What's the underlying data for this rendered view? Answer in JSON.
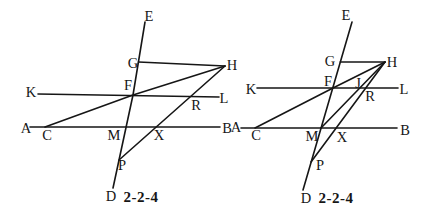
{
  "colors": {
    "ink": "#161616",
    "paper": "#ffffff"
  },
  "diagrams": [
    {
      "name": "left",
      "caption": "2-2-4",
      "caption_pos": {
        "x": 141,
        "y": 197
      },
      "lines": [
        {
          "name": "transversal-ED",
          "points": [
            [
              145,
              22
            ],
            [
              133,
              95
            ],
            [
              113,
              188
            ]
          ]
        },
        {
          "name": "horizontal-KL",
          "points": [
            [
              38,
              94
            ],
            [
              219,
              97
            ]
          ]
        },
        {
          "name": "horizontal-AB",
          "points": [
            [
              30,
              127
            ],
            [
              220,
              127
            ]
          ]
        },
        {
          "name": "segment-GH",
          "points": [
            [
              138.5,
              62
            ],
            [
              225,
              66
            ]
          ]
        },
        {
          "name": "line-CFH",
          "points": [
            [
              45,
              127
            ],
            [
              133,
              95
            ],
            [
              225,
              66
            ]
          ]
        },
        {
          "name": "line-HRXP",
          "points": [
            [
              225,
              66
            ],
            [
              119,
              160
            ]
          ]
        }
      ],
      "labels": [
        {
          "text": "E",
          "x": 149,
          "y": 16
        },
        {
          "text": "G",
          "x": 133,
          "y": 63
        },
        {
          "text": "H",
          "x": 232,
          "y": 65
        },
        {
          "text": "K",
          "x": 31,
          "y": 92
        },
        {
          "text": "F",
          "x": 128,
          "y": 85
        },
        {
          "text": "R",
          "x": 196,
          "y": 105
        },
        {
          "text": "L",
          "x": 224,
          "y": 98
        },
        {
          "text": "A",
          "x": 26,
          "y": 128
        },
        {
          "text": "C",
          "x": 47,
          "y": 135
        },
        {
          "text": "M",
          "x": 114,
          "y": 135
        },
        {
          "text": "X",
          "x": 159,
          "y": 135
        },
        {
          "text": "B",
          "x": 227,
          "y": 128
        },
        {
          "text": "P",
          "x": 122,
          "y": 165
        },
        {
          "text": "D",
          "x": 111,
          "y": 196
        }
      ]
    },
    {
      "name": "right",
      "caption": "2-2-4",
      "caption_pos": {
        "x": 336,
        "y": 198
      },
      "lines": [
        {
          "name": "transversal-ED",
          "points": [
            [
              352,
              22
            ],
            [
              303,
              190
            ]
          ]
        },
        {
          "name": "horizontal-KL",
          "points": [
            [
              257,
              88
            ],
            [
              398,
              88
            ]
          ]
        },
        {
          "name": "horizontal-AB",
          "points": [
            [
              241,
              128
            ],
            [
              397,
              128
            ]
          ]
        },
        {
          "name": "segment-GH",
          "points": [
            [
              340.3,
              62
            ],
            [
              385,
              62
            ]
          ]
        },
        {
          "name": "line-CFH",
          "points": [
            [
              255,
              128
            ],
            [
              333,
              88
            ],
            [
              385,
              62
            ]
          ]
        },
        {
          "name": "line-HRXP",
          "points": [
            [
              385,
              62
            ],
            [
              311,
              162
            ]
          ]
        },
        {
          "name": "segment-MJH",
          "points": [
            [
              321,
              128
            ],
            [
              385,
              62
            ]
          ]
        }
      ],
      "labels": [
        {
          "text": "E",
          "x": 346,
          "y": 15
        },
        {
          "text": "G",
          "x": 330,
          "y": 61
        },
        {
          "text": "H",
          "x": 392,
          "y": 62
        },
        {
          "text": "K",
          "x": 251,
          "y": 89
        },
        {
          "text": "F",
          "x": 328,
          "y": 81
        },
        {
          "text": "J",
          "x": 358,
          "y": 83
        },
        {
          "text": "R",
          "x": 370,
          "y": 96
        },
        {
          "text": "L",
          "x": 404,
          "y": 89
        },
        {
          "text": "A",
          "x": 236,
          "y": 127
        },
        {
          "text": "C",
          "x": 256,
          "y": 135
        },
        {
          "text": "M",
          "x": 312,
          "y": 136
        },
        {
          "text": "X",
          "x": 342,
          "y": 137
        },
        {
          "text": "B",
          "x": 405,
          "y": 130
        },
        {
          "text": "P",
          "x": 320,
          "y": 165
        },
        {
          "text": "D",
          "x": 306,
          "y": 198
        }
      ]
    }
  ]
}
